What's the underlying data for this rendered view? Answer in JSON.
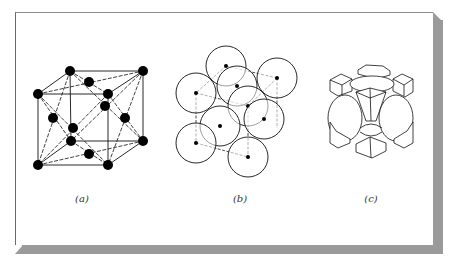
{
  "figure": {
    "panels": [
      {
        "id": "a",
        "label": "(a)",
        "label_x": 82,
        "description": "Face-centered cubic unit cell, ball-and-stick with face diagonals"
      },
      {
        "id": "b",
        "label": "(b)",
        "label_x": 240,
        "description": "Face-centered cubic unit cell, atoms drawn as circles (reduced-sphere outline)"
      },
      {
        "id": "c",
        "label": "(c)",
        "label_x": 371,
        "description": "Face-centered cubic unit cell, truncated atoms within cell boundaries"
      }
    ],
    "panel_a": {
      "nodes": [
        [
          70,
          71
        ],
        [
          143,
          71
        ],
        [
          38,
          94
        ],
        [
          108,
          94
        ],
        [
          89,
          82
        ],
        [
          105,
          106
        ],
        [
          53,
          118
        ],
        [
          125,
          118
        ],
        [
          73,
          128
        ],
        [
          71,
          141
        ],
        [
          143,
          141
        ],
        [
          89,
          154
        ],
        [
          38,
          165
        ],
        [
          108,
          165
        ]
      ],
      "node_radius": 5
    },
    "panel_b": {
      "circles": [
        [
          226,
          66
        ],
        [
          196,
          93
        ],
        [
          237,
          86
        ],
        [
          277,
          78
        ],
        [
          248,
          106
        ],
        [
          264,
          119
        ],
        [
          220,
          126
        ],
        [
          196,
          143
        ],
        [
          248,
          157
        ]
      ],
      "circle_radius": 20,
      "dot_radius": 2
    }
  }
}
